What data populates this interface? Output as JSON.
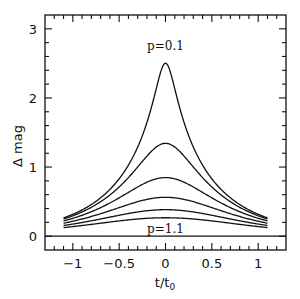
{
  "chart_data": {
    "type": "line",
    "title": "",
    "xlabel": "t/t0",
    "xlabel_main": "t/t",
    "xlabel_sub": "0",
    "ylabel": "Δ mag",
    "xlim": [
      -1.3,
      1.3
    ],
    "ylim": [
      -0.2,
      3.2
    ],
    "grid": false,
    "legend": "none",
    "xticks": [
      -1,
      -0.5,
      0,
      0.5,
      1
    ],
    "xtick_labels": [
      "−1",
      "−0.5",
      "0",
      "0.5",
      "1"
    ],
    "yticks": [
      0,
      1,
      2,
      3
    ],
    "ytick_labels": [
      "0",
      "1",
      "2",
      "3"
    ],
    "annotations": [
      {
        "text": "p=0.1",
        "x": 0,
        "y": 2.75
      },
      {
        "text": "p=1.1",
        "x": 0,
        "y": 0.11
      }
    ],
    "x": [
      -1.1,
      -1.0,
      -0.9,
      -0.8,
      -0.7,
      -0.6,
      -0.5,
      -0.4,
      -0.3,
      -0.2,
      -0.1,
      0,
      0.1,
      0.2,
      0.3,
      0.4,
      0.5,
      0.6,
      0.7,
      0.8,
      0.9,
      1.0,
      1.1
    ],
    "series": [
      {
        "name": "p=0.1",
        "p": 0.1,
        "peak": 2.5,
        "values": [
          0.265,
          0.316,
          0.38,
          0.458,
          0.555,
          0.676,
          0.83,
          1.028,
          1.289,
          1.646,
          2.132,
          2.504,
          2.132,
          1.646,
          1.289,
          1.028,
          0.83,
          0.676,
          0.555,
          0.458,
          0.38,
          0.316,
          0.265
        ]
      },
      {
        "name": "p=0.3",
        "p": 0.3,
        "peak": 1.34,
        "values": [
          0.248,
          0.295,
          0.35,
          0.417,
          0.498,
          0.596,
          0.712,
          0.847,
          1.001,
          1.158,
          1.289,
          1.343,
          1.289,
          1.158,
          1.001,
          0.847,
          0.712,
          0.596,
          0.498,
          0.417,
          0.35,
          0.295,
          0.248
        ]
      },
      {
        "name": "p=0.5",
        "p": 0.5,
        "peak": 0.85,
        "values": [
          0.221,
          0.258,
          0.303,
          0.354,
          0.413,
          0.48,
          0.555,
          0.633,
          0.712,
          0.781,
          0.83,
          0.847,
          0.83,
          0.781,
          0.712,
          0.633,
          0.555,
          0.48,
          0.413,
          0.354,
          0.303,
          0.258,
          0.221
        ]
      },
      {
        "name": "p=0.7",
        "p": 0.7,
        "peak": 0.56,
        "values": [
          0.188,
          0.216,
          0.248,
          0.285,
          0.325,
          0.368,
          0.413,
          0.458,
          0.498,
          0.532,
          0.555,
          0.563,
          0.555,
          0.532,
          0.498,
          0.458,
          0.413,
          0.368,
          0.325,
          0.285,
          0.248,
          0.216,
          0.188
        ]
      },
      {
        "name": "p=0.9",
        "p": 0.9,
        "peak": 0.38,
        "values": [
          0.154,
          0.175,
          0.198,
          0.222,
          0.248,
          0.276,
          0.303,
          0.328,
          0.35,
          0.368,
          0.38,
          0.384,
          0.38,
          0.368,
          0.35,
          0.328,
          0.303,
          0.276,
          0.248,
          0.222,
          0.198,
          0.175,
          0.154
        ]
      },
      {
        "name": "p=1.1",
        "p": 1.1,
        "peak": 0.27,
        "values": [
          0.124,
          0.139,
          0.154,
          0.171,
          0.188,
          0.205,
          0.221,
          0.236,
          0.248,
          0.258,
          0.265,
          0.267,
          0.265,
          0.258,
          0.248,
          0.236,
          0.221,
          0.205,
          0.188,
          0.171,
          0.154,
          0.139,
          0.124
        ]
      }
    ],
    "baseline": {
      "name": "zero-line",
      "y": 0
    },
    "line_color": "#111111"
  }
}
